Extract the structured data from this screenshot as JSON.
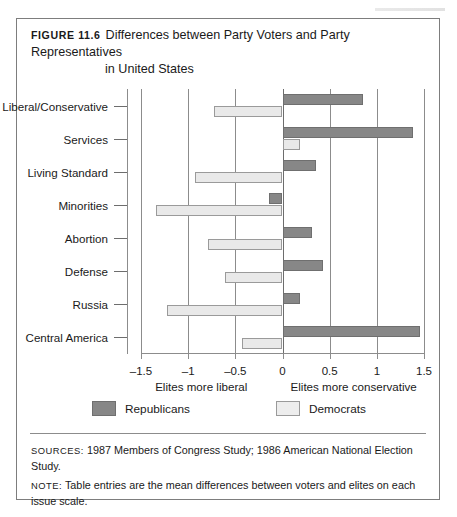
{
  "figure": {
    "label": "Figure 11.6",
    "title_line1": "Differences between Party Voters and Party Representatives",
    "title_line2": "in United States"
  },
  "legend": {
    "items": [
      {
        "label": "Republicans",
        "color": "#878787"
      },
      {
        "label": "Democrats",
        "color": "#ededed"
      }
    ]
  },
  "footer": {
    "sources_label": "Sources:",
    "sources_text": "1987 Members of Congress Study; 1986 American National Election Study.",
    "note_label": "Note:",
    "note_text": "Table entries are the mean differences between voters and elites on each issue scale."
  },
  "chart_data": {
    "type": "bar",
    "orientation": "horizontal",
    "title": "Differences between Party Voters and Party Representatives in United States",
    "xlabel": "",
    "ylabel": "",
    "xlim": [
      -1.5,
      1.5
    ],
    "xticks": [
      -1.5,
      -1,
      -0.5,
      0,
      0.5,
      1,
      1.5
    ],
    "xticklabels": [
      "–1.5",
      "–1",
      "–0.5",
      "0",
      "0.5",
      "1",
      "1.5"
    ],
    "grid": true,
    "legend_position": "bottom",
    "axis_note_left": "Elites more liberal",
    "axis_note_right": "Elites more conservative",
    "categories": [
      "Liberal/Conservative",
      "Services",
      "Living Standard",
      "Minorities",
      "Abortion",
      "Defense",
      "Russia",
      "Central America"
    ],
    "series": [
      {
        "name": "Republicans",
        "color": "#878787",
        "values": [
          0.85,
          1.38,
          0.36,
          -0.14,
          0.31,
          0.43,
          0.19,
          1.46
        ]
      },
      {
        "name": "Democrats",
        "color": "#ededed",
        "values": [
          -0.73,
          0.19,
          -0.93,
          -1.34,
          -0.79,
          -0.61,
          -1.22,
          -0.43
        ]
      }
    ]
  }
}
